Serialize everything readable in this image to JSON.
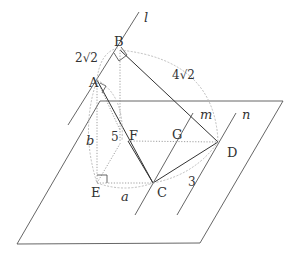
{
  "diagram": {
    "points": {
      "A": "A",
      "B": "B",
      "C": "C",
      "D": "D",
      "E": "E",
      "F": "F",
      "G": "G"
    },
    "lines": {
      "l": "l",
      "m": "m",
      "n": "n"
    },
    "measures": {
      "AB": "2√2",
      "BD": "4√2",
      "AF": "5",
      "CD": "3",
      "AE": "b",
      "EC": "a"
    },
    "colors": {
      "line": "#555555",
      "arc": "#b5b5b5",
      "text": "#333333"
    }
  }
}
